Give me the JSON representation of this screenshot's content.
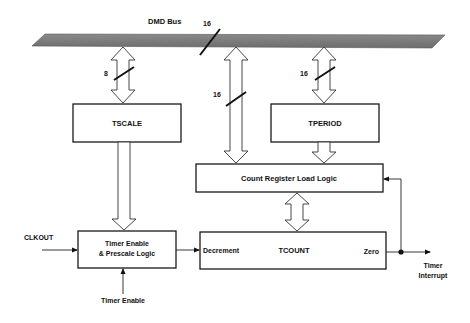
{
  "diagram": {
    "bus": {
      "label": "DMD Bus",
      "width_label": "16",
      "color": "#7a7a7a"
    },
    "connections": {
      "bus_to_tscale": {
        "width_label": "8"
      },
      "bus_to_count_load": {
        "width_label": "16"
      },
      "bus_to_tperiod": {
        "width_label": "16"
      }
    },
    "blocks": {
      "tscale": {
        "label": "TSCALE"
      },
      "tperiod": {
        "label": "TPERIOD"
      },
      "count_load": {
        "label": "Count Register Load Logic"
      },
      "prescale": {
        "line1": "Timer Enable",
        "line2": "& Prescale Logic"
      },
      "tcount": {
        "label": "TCOUNT",
        "input_label": "Decrement",
        "output_label": "Zero"
      }
    },
    "signals": {
      "clkout": "CLKOUT",
      "timer_enable": "Timer Enable",
      "timer_interrupt_line1": "Timer",
      "timer_interrupt_line2": "Interrupt"
    }
  }
}
